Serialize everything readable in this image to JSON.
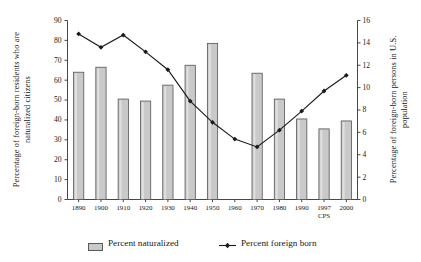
{
  "chart_data": {
    "type": "bar",
    "title": "",
    "subtitle": "",
    "xlabel": "",
    "ylabel": "Percentage of foreign-born residents who are naturalized citizens",
    "ylabel_right": "Percentage of foreign-born persons in U.S. population",
    "categories": [
      "1890",
      "1900",
      "1910",
      "1920",
      "1930",
      "1940",
      "1950",
      "1960",
      "1970",
      "1980",
      "1990",
      "1997",
      "2000"
    ],
    "annotations": [
      "CPS"
    ],
    "grid": false,
    "legend_position": "bottom",
    "ylim": [
      0,
      90
    ],
    "yticks": [
      0,
      10,
      20,
      30,
      40,
      50,
      60,
      70,
      80,
      90
    ],
    "ylim_right": [
      0,
      16
    ],
    "yticks_right": [
      0,
      2,
      4,
      6,
      8,
      10,
      12,
      14,
      16
    ],
    "series": [
      {
        "name": "Percent naturalized",
        "type": "bar",
        "axis": "left",
        "color": "#c9c9c9",
        "edge_color": "#555555",
        "values": [
          64.0,
          66.5,
          50.5,
          49.5,
          57.5,
          67.5,
          78.5,
          null,
          63.5,
          50.5,
          40.5,
          35.5,
          39.5
        ]
      },
      {
        "name": "Percent foreign born",
        "type": "line",
        "axis": "right",
        "color": "#1a1a1a",
        "marker": "diamond",
        "values": [
          14.8,
          13.6,
          14.7,
          13.2,
          11.6,
          8.8,
          6.9,
          5.4,
          4.7,
          6.2,
          7.9,
          9.7,
          11.1
        ]
      }
    ]
  },
  "legend": {
    "bar_label": "Percent naturalized",
    "line_label": "Percent foreign born"
  },
  "axis_titles": {
    "left": "Percentage of foreign-born residents who are naturalized citizens",
    "right": "Percentage of foreign-born persons in U.S. population"
  },
  "cps_note": "CPS"
}
